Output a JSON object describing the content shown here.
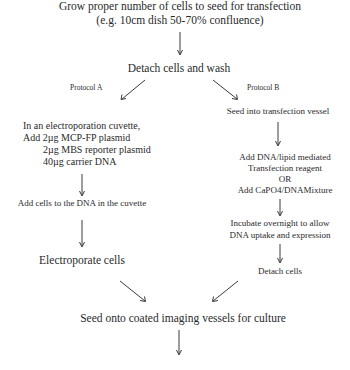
{
  "diagram": {
    "nodes": {
      "start": {
        "line1": "Grow proper number of cells to seed for transfection",
        "line2": "(e.g. 10cm dish 50-70% confluence)"
      },
      "detach_wash": "Detach cells and wash",
      "protocol_a_label": "Protocol A",
      "protocol_b_label": "Protocol B",
      "a_step1": {
        "line1": "In an electroporation cuvette,",
        "line2": "Add 2µg MCP-FP plasmid",
        "line3": "2µg MBS reporter plasmid",
        "line4": "40µg carrier DNA"
      },
      "a_step2": "Add cells to the DNA in the cuvette",
      "a_step3": "Electroporate cells",
      "b_step1": "Seed into transfection vessel",
      "b_step2": {
        "line1": "Add DNA/lipid mediated",
        "line2": "Transfection reagent",
        "line3": "OR",
        "line4": "Add CaPO4/DNAMixture"
      },
      "b_step3": {
        "line1": "Incubate overnight to allow",
        "line2": "DNA uptake and expression"
      },
      "b_step4": "Detach cells",
      "end": "Seed onto coated imaging vessels for culture"
    },
    "edges": [
      {
        "from": "start",
        "to": "detach_wash"
      },
      {
        "from": "detach_wash",
        "to": "a_step1",
        "label": "Protocol A"
      },
      {
        "from": "detach_wash",
        "to": "b_step1",
        "label": "Protocol B"
      },
      {
        "from": "a_step1",
        "to": "a_step2"
      },
      {
        "from": "a_step2",
        "to": "a_step3"
      },
      {
        "from": "a_step3",
        "to": "end"
      },
      {
        "from": "b_step1",
        "to": "b_step2"
      },
      {
        "from": "b_step2",
        "to": "b_step3"
      },
      {
        "from": "b_step3",
        "to": "b_step4"
      },
      {
        "from": "b_step4",
        "to": "end"
      },
      {
        "from": "end",
        "to": "next"
      }
    ]
  }
}
